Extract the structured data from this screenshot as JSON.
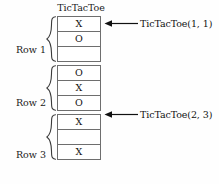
{
  "diagram": {
    "title": "TicTacToe",
    "array": {
      "name": "TicTacToe",
      "cell_count": 9,
      "groups": [
        {
          "label": "Row 1",
          "cells": [
            {
              "index": 1,
              "value": "X"
            },
            {
              "index": 2,
              "value": "O"
            },
            {
              "index": 3,
              "value": ""
            }
          ]
        },
        {
          "label": "Row 2",
          "cells": [
            {
              "index": 4,
              "value": "O"
            },
            {
              "index": 5,
              "value": "X"
            },
            {
              "index": 6,
              "value": "O"
            }
          ]
        },
        {
          "label": "Row 3",
          "cells": [
            {
              "index": 7,
              "value": "X"
            },
            {
              "index": 8,
              "value": ""
            },
            {
              "index": 9,
              "value": "X"
            }
          ]
        }
      ]
    },
    "annotations": [
      {
        "text": "TicTacToe(1, 1)",
        "points_to_cell": 1
      },
      {
        "text": "TicTacToe(2, 3)",
        "points_to_cell": 6
      }
    ],
    "colors": {
      "cell_border": "#6e6e6e",
      "cell_fill": "#ffffff",
      "text": "#111111",
      "brace": "#3a3a3a",
      "background": "#fefefe"
    }
  }
}
